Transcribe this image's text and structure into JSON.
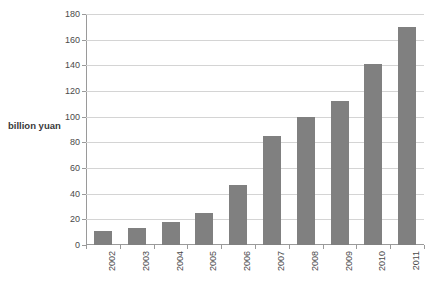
{
  "chart_data": {
    "type": "bar",
    "title": "",
    "xlabel": "",
    "ylabel": "billion yuan",
    "categories": [
      "2002",
      "2003",
      "2004",
      "2005",
      "2006",
      "2007",
      "2008",
      "2009",
      "2010",
      "2011"
    ],
    "values": [
      11,
      13,
      18,
      25,
      47,
      85,
      100,
      112,
      141,
      170
    ],
    "ylim": [
      0,
      180
    ],
    "ytick_labels": [
      "0",
      "20",
      "40",
      "60",
      "80",
      "100",
      "120",
      "140",
      "160",
      "180"
    ],
    "ytick_values": [
      0,
      20,
      40,
      60,
      80,
      100,
      120,
      140,
      160,
      180
    ],
    "grid": "horizontal",
    "legend": "none",
    "series": [
      {
        "name": "billion yuan",
        "color": "#808080",
        "values": [
          11,
          13,
          18,
          25,
          47,
          85,
          100,
          112,
          141,
          170
        ]
      }
    ],
    "colors": {
      "bar": "#808080",
      "gridline": "#d4d4d4",
      "axis": "#9a9a9a",
      "text": "#4a4a4a"
    }
  }
}
